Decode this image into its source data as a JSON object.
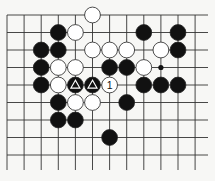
{
  "diagram": {
    "type": "go-board",
    "grid": {
      "origin_x": 7,
      "origin_y": 15,
      "spacing_x": 17.1,
      "spacing_y": 17.5,
      "columns": 12,
      "rows": 9,
      "open_right_to_x": 208,
      "open_bottom_to_y": 170,
      "line_color": "#333333"
    },
    "colors": {
      "background": "#f7f7f5",
      "black_stone": "#111111",
      "white_stone": "#ffffff",
      "stone_outline": "#222222"
    },
    "stones": [
      {
        "col": 5,
        "row": 0,
        "color": "white"
      },
      {
        "col": 3,
        "row": 1,
        "color": "black"
      },
      {
        "col": 4,
        "row": 1,
        "color": "white"
      },
      {
        "col": 8,
        "row": 1,
        "color": "black"
      },
      {
        "col": 10,
        "row": 1,
        "color": "black"
      },
      {
        "col": 2,
        "row": 2,
        "color": "black"
      },
      {
        "col": 3,
        "row": 2,
        "color": "black"
      },
      {
        "col": 5,
        "row": 2,
        "color": "white"
      },
      {
        "col": 6,
        "row": 2,
        "color": "white"
      },
      {
        "col": 7,
        "row": 2,
        "color": "white"
      },
      {
        "col": 9,
        "row": 2,
        "color": "white"
      },
      {
        "col": 10,
        "row": 2,
        "color": "black"
      },
      {
        "col": 2,
        "row": 3,
        "color": "black"
      },
      {
        "col": 3,
        "row": 3,
        "color": "white"
      },
      {
        "col": 4,
        "row": 3,
        "color": "white"
      },
      {
        "col": 6,
        "row": 3,
        "color": "black"
      },
      {
        "col": 7,
        "row": 3,
        "color": "black"
      },
      {
        "col": 8,
        "row": 3,
        "color": "white"
      },
      {
        "col": 2,
        "row": 4,
        "color": "black"
      },
      {
        "col": 3,
        "row": 4,
        "color": "white"
      },
      {
        "col": 4,
        "row": 4,
        "color": "black",
        "mark": "triangle"
      },
      {
        "col": 5,
        "row": 4,
        "color": "black",
        "mark": "triangle"
      },
      {
        "col": 6,
        "row": 4,
        "color": "white",
        "label": "1"
      },
      {
        "col": 8,
        "row": 4,
        "color": "black"
      },
      {
        "col": 9,
        "row": 4,
        "color": "black"
      },
      {
        "col": 10,
        "row": 4,
        "color": "black"
      },
      {
        "col": 3,
        "row": 5,
        "color": "black"
      },
      {
        "col": 4,
        "row": 5,
        "color": "white"
      },
      {
        "col": 5,
        "row": 5,
        "color": "white"
      },
      {
        "col": 7,
        "row": 5,
        "color": "black"
      },
      {
        "col": 3,
        "row": 6,
        "color": "black"
      },
      {
        "col": 4,
        "row": 6,
        "color": "black"
      },
      {
        "col": 6,
        "row": 7,
        "color": "black"
      }
    ],
    "point_marks": [
      {
        "col": 9,
        "row": 3,
        "type": "dot"
      }
    ]
  }
}
